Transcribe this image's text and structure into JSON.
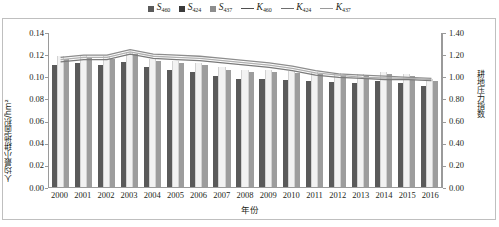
{
  "chart_data": {
    "type": "bar",
    "title": "",
    "xlabel": "年份",
    "ylabel_left": "人均最小耕地面积/hm²",
    "ylabel_right": "耕地压力指数",
    "categories": [
      "2000",
      "2001",
      "2002",
      "2003",
      "2004",
      "2005",
      "2006",
      "2007",
      "2008",
      "2009",
      "2010",
      "2011",
      "2012",
      "2013",
      "2014",
      "2015",
      "2016"
    ],
    "ylim_left": [
      0.0,
      0.14
    ],
    "ytick_left": [
      "0.00",
      "0.02",
      "0.04",
      "0.06",
      "0.08",
      "0.10",
      "0.12",
      "0.14"
    ],
    "ylim_right": [
      0.0,
      1.4
    ],
    "ytick_right": [
      "0.00",
      "0.20",
      "0.40",
      "0.60",
      "0.80",
      "1.00",
      "1.20",
      "1.40"
    ],
    "grid": false,
    "legend_position": "top-center",
    "bar_series": [
      {
        "name": "S460",
        "symbol": "S",
        "subscript": "460",
        "color": "#5a5a5a",
        "axis": "left",
        "values": [
          0.11,
          0.112,
          0.11,
          0.113,
          0.108,
          0.106,
          0.104,
          0.1,
          0.098,
          0.098,
          0.097,
          0.096,
          0.095,
          0.094,
          0.096,
          0.094,
          0.091
        ]
      },
      {
        "name": "S424",
        "symbol": "S",
        "subscript": "424",
        "color": "#f2f2f2",
        "axis": "left",
        "values": [
          0.118,
          0.119,
          0.118,
          0.122,
          0.116,
          0.114,
          0.112,
          0.108,
          0.106,
          0.106,
          0.105,
          0.104,
          0.103,
          0.102,
          0.104,
          0.102,
          0.098
        ]
      },
      {
        "name": "S437",
        "symbol": "S",
        "subscript": "437",
        "color": "#9d9d9d",
        "axis": "left",
        "values": [
          0.116,
          0.117,
          0.116,
          0.12,
          0.114,
          0.112,
          0.11,
          0.106,
          0.104,
          0.104,
          0.103,
          0.102,
          0.101,
          0.1,
          0.102,
          0.1,
          0.096
        ]
      }
    ],
    "line_series": [
      {
        "name": "K460",
        "symbol": "K",
        "subscript": "460",
        "color": "#7a7a7a",
        "axis": "right",
        "values": [
          1.14,
          1.16,
          1.16,
          1.21,
          1.17,
          1.16,
          1.15,
          1.13,
          1.11,
          1.09,
          1.06,
          1.02,
          1.0,
          0.99,
          0.98,
          0.98,
          0.97
        ]
      },
      {
        "name": "K424",
        "symbol": "K",
        "subscript": "424",
        "color": "#8d8d8d",
        "axis": "right",
        "values": [
          1.18,
          1.2,
          1.2,
          1.25,
          1.21,
          1.2,
          1.19,
          1.17,
          1.15,
          1.13,
          1.1,
          1.06,
          1.03,
          1.02,
          1.01,
          1.0,
          0.99
        ]
      },
      {
        "name": "K437",
        "symbol": "K",
        "subscript": "437",
        "color": "#b0b0b0",
        "axis": "right",
        "values": [
          1.16,
          1.18,
          1.18,
          1.23,
          1.19,
          1.18,
          1.17,
          1.15,
          1.13,
          1.11,
          1.08,
          1.04,
          1.02,
          1.0,
          0.995,
          0.99,
          0.98
        ]
      }
    ]
  }
}
